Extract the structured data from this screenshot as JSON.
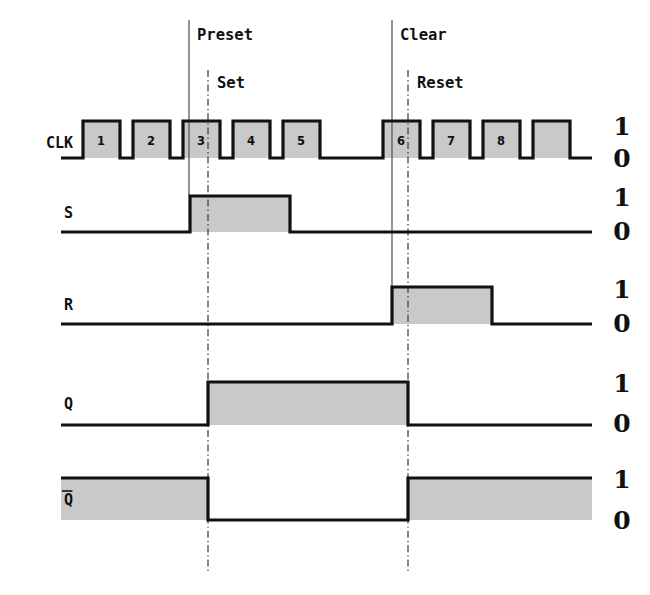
{
  "figure": {
    "type": "digital-timing-diagram",
    "title_present": false
  },
  "level_labels": {
    "high": "1",
    "low": "0"
  },
  "markers": [
    {
      "id": "preset",
      "label": "Preset",
      "style": "solid",
      "x": 189,
      "label_x": 197,
      "label_y": 35,
      "y_top": 20,
      "y_bottom": 196
    },
    {
      "id": "set",
      "label": "Set",
      "style": "dash-dot",
      "x": 208,
      "label_x": 217,
      "label_y": 83,
      "y_top": 70,
      "y_bottom": 572
    },
    {
      "id": "clear",
      "label": "Clear",
      "style": "solid",
      "x": 392,
      "label_x": 400,
      "label_y": 35,
      "y_top": 20,
      "y_bottom": 292
    },
    {
      "id": "reset",
      "label": "Reset",
      "style": "dash-dot",
      "x": 408,
      "label_x": 417,
      "label_y": 83,
      "y_top": 70,
      "y_bottom": 572
    }
  ],
  "signals": [
    {
      "name": "CLK",
      "label": "CLK",
      "label_overbar": false,
      "label_x": 73,
      "label_y": 143,
      "y_high": 121,
      "y_low": 158,
      "x_start": 61,
      "x_end": 592,
      "level_high_y": 128,
      "level_low_y": 160,
      "level_x": 622,
      "initial_level": 0,
      "transitions": [
        83,
        120,
        133,
        170,
        183,
        220,
        233,
        270,
        283,
        320,
        383,
        420,
        433,
        470,
        483,
        520,
        533,
        570
      ],
      "pulse_numbers": [
        "1",
        "2",
        "3",
        "4",
        "5",
        "6",
        "7",
        "8"
      ],
      "pulse_centers": [
        101,
        151,
        201,
        251,
        301,
        401,
        451,
        501
      ],
      "pulse_label_y": 141
    },
    {
      "name": "S",
      "label": "S",
      "label_overbar": false,
      "label_x": 73,
      "label_y": 213,
      "y_high": 196,
      "y_low": 232,
      "x_start": 61,
      "x_end": 592,
      "level_high_y": 199,
      "level_low_y": 233,
      "level_x": 622,
      "initial_level": 0,
      "transitions": [
        190,
        290
      ]
    },
    {
      "name": "R",
      "label": "R",
      "label_overbar": false,
      "label_x": 73,
      "label_y": 305,
      "y_high": 287,
      "y_low": 324,
      "x_start": 61,
      "x_end": 592,
      "level_high_y": 291,
      "level_low_y": 325,
      "level_x": 622,
      "initial_level": 0,
      "transitions": [
        392,
        492
      ]
    },
    {
      "name": "Q",
      "label": "Q",
      "label_overbar": false,
      "label_x": 73,
      "label_y": 404,
      "y_high": 382,
      "y_low": 425,
      "x_start": 61,
      "x_end": 592,
      "level_high_y": 385,
      "level_low_y": 425,
      "level_x": 622,
      "initial_level": 0,
      "transitions": [
        208,
        408
      ]
    },
    {
      "name": "Qbar",
      "label": "Q",
      "label_overbar": true,
      "label_x": 73,
      "label_y": 500,
      "y_high": 478,
      "y_low": 520,
      "x_start": 61,
      "x_end": 592,
      "level_high_y": 481,
      "level_low_y": 522,
      "level_x": 622,
      "initial_level": 1,
      "transitions": [
        208,
        408
      ]
    }
  ],
  "colors": {
    "waveform_stroke": "#111111",
    "waveform_fill": "#c9c9c9",
    "marker_solid": "#5a5a5a",
    "marker_dashdot": "#3a3a3a",
    "background": "#ffffff",
    "text": "#111111"
  }
}
